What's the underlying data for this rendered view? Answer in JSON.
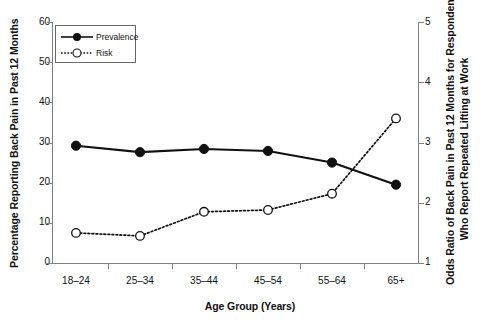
{
  "chart_data": {
    "type": "line",
    "title": "",
    "xlabel": "Age Group (Years)",
    "categories": [
      "18–24",
      "25–34",
      "35–44",
      "45–54",
      "55–64",
      "65+"
    ],
    "grid": false,
    "legend_position": "top-left",
    "axes": {
      "left": {
        "label": "Percentage Reporting Back Pain in Past 12 Months",
        "ticks": [
          0,
          10,
          20,
          30,
          40,
          50,
          60
        ],
        "ylim": [
          0,
          60
        ]
      },
      "right": {
        "label_line1": "Odds Ratio of Back Pain in Past 12 Months for Respondents",
        "label_line2": "Who Report Repeated Lifting at Work",
        "ticks": [
          1,
          2,
          3,
          4,
          5
        ],
        "ylim": [
          1,
          5
        ]
      }
    },
    "series": [
      {
        "name": "Prevalence",
        "axis": "left",
        "marker": "filled-circle",
        "line": "solid",
        "values": [
          29.2,
          27.6,
          28.4,
          27.9,
          25.0,
          19.5
        ]
      },
      {
        "name": "Risk",
        "axis": "right",
        "marker": "open-circle",
        "line": "dotted",
        "values": [
          1.5,
          1.45,
          1.85,
          1.88,
          2.15,
          3.4
        ]
      }
    ]
  },
  "legend": {
    "items": [
      {
        "label": "Prevalence",
        "marker": "filled-circle",
        "line": "solid"
      },
      {
        "label": "Risk",
        "marker": "open-circle",
        "line": "dotted"
      }
    ]
  },
  "ticks": {
    "left": [
      "60",
      "50",
      "40",
      "30",
      "20",
      "10",
      "0"
    ],
    "right": [
      "5",
      "4",
      "3",
      "2",
      "1"
    ],
    "x": [
      "18–24",
      "25–34",
      "35–44",
      "45–54",
      "55–64",
      "65+"
    ]
  },
  "labels": {
    "y_left_title": "Percentage Reporting Back Pain in Past 12 Months",
    "y_right_title_1": "Odds Ratio of Back Pain in Past 12 Months for Respondents",
    "y_right_title_2": "Who Report Repeated Lifting at Work",
    "x_title": "Age Group (Years)"
  },
  "colors": {
    "ink": "#111111",
    "axis": "#808080",
    "series_prevalence": "#111111",
    "series_risk": "#111111",
    "background": "#ffffff"
  }
}
